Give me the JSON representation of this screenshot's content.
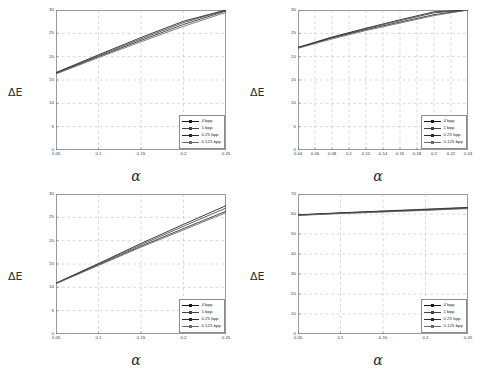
{
  "figure": {
    "ylabel": "ΔE",
    "xlabel": "α",
    "legend_labels": [
      "4 bpp",
      "1 bpp",
      "0.25 bpp",
      "0.125 bpp"
    ],
    "series_colors": [
      "#1a1a1a",
      "#444444",
      "#2b2b2b",
      "#6a6a6a"
    ]
  },
  "chart_data": [
    {
      "type": "line",
      "panel": "top-left",
      "title": "",
      "xlabel": "α",
      "ylabel": "ΔE",
      "xlim": [
        0.05,
        0.25
      ],
      "ylim": [
        0,
        30
      ],
      "xticks": [
        0.05,
        0.1,
        0.15,
        0.2,
        0.25
      ],
      "xticklabels": [
        "0.05",
        "0.1",
        "0.15",
        "0.2",
        "0.25"
      ],
      "yticks": [
        0,
        5,
        10,
        15,
        20,
        25,
        30
      ],
      "yticklabels": [
        "0",
        "5",
        "10",
        "15",
        "20",
        "25",
        "30"
      ],
      "grid": true,
      "legend_position": "lower right",
      "x": [
        0.05,
        0.1,
        0.15,
        0.2,
        0.25
      ],
      "series": [
        {
          "name": "4 bpp",
          "values": [
            16.6,
            20.4,
            24.1,
            27.6,
            30.0
          ]
        },
        {
          "name": "1 bpp",
          "values": [
            16.5,
            20.2,
            23.8,
            27.3,
            30.0
          ]
        },
        {
          "name": "0.25 bpp",
          "values": [
            16.4,
            20.0,
            23.5,
            26.9,
            29.8
          ]
        },
        {
          "name": "0.125 bpp",
          "values": [
            16.3,
            19.8,
            23.2,
            26.5,
            29.5
          ]
        }
      ]
    },
    {
      "type": "line",
      "panel": "top-right",
      "title": "",
      "xlabel": "α",
      "ylabel": "ΔE",
      "xlim": [
        0.04,
        0.24
      ],
      "ylim": [
        0,
        30
      ],
      "xticks": [
        0.04,
        0.06,
        0.08,
        0.1,
        0.12,
        0.14,
        0.16,
        0.18,
        0.2,
        0.22,
        0.24
      ],
      "xticklabels": [
        "0.04",
        "0.06",
        "0.08",
        "0.1",
        "0.12",
        "0.14",
        "0.16",
        "0.18",
        "0.2",
        "0.22",
        "0.24"
      ],
      "yticks": [
        0,
        5,
        10,
        15,
        20,
        25,
        30
      ],
      "yticklabels": [
        "0",
        "5",
        "10",
        "15",
        "20",
        "25",
        "30"
      ],
      "grid": true,
      "legend_position": "lower right",
      "x": [
        0.04,
        0.08,
        0.12,
        0.16,
        0.2,
        0.24
      ],
      "series": [
        {
          "name": "4 bpp",
          "values": [
            22.0,
            24.2,
            26.1,
            27.9,
            29.6,
            30.0
          ]
        },
        {
          "name": "1 bpp",
          "values": [
            21.9,
            24.1,
            26.0,
            27.7,
            29.4,
            30.0
          ]
        },
        {
          "name": "0.25 bpp",
          "values": [
            21.9,
            24.0,
            25.8,
            27.4,
            29.0,
            30.0
          ]
        },
        {
          "name": "0.125 bpp",
          "values": [
            21.8,
            23.8,
            25.6,
            27.2,
            28.8,
            30.0
          ]
        }
      ]
    },
    {
      "type": "line",
      "panel": "bottom-left",
      "title": "",
      "xlabel": "α",
      "ylabel": "ΔE",
      "xlim": [
        0.05,
        0.25
      ],
      "ylim": [
        0,
        30
      ],
      "xticks": [
        0.05,
        0.1,
        0.15,
        0.2,
        0.25
      ],
      "xticklabels": [
        "0.05",
        "0.1",
        "0.15",
        "0.2",
        "0.25"
      ],
      "yticks": [
        0,
        5,
        10,
        15,
        20,
        25,
        30
      ],
      "yticklabels": [
        "0",
        "5",
        "10",
        "15",
        "20",
        "25",
        "30"
      ],
      "grid": true,
      "legend_position": "lower right",
      "x": [
        0.05,
        0.1,
        0.15,
        0.2,
        0.25
      ],
      "series": [
        {
          "name": "4 bpp",
          "values": [
            10.9,
            15.1,
            19.4,
            23.5,
            27.5
          ]
        },
        {
          "name": "1 bpp",
          "values": [
            10.9,
            15.0,
            19.1,
            23.1,
            27.0
          ]
        },
        {
          "name": "0.25 bpp",
          "values": [
            10.8,
            14.8,
            18.8,
            22.6,
            26.3
          ]
        },
        {
          "name": "0.125 bpp",
          "values": [
            10.8,
            14.7,
            18.6,
            22.3,
            26.0
          ]
        }
      ]
    },
    {
      "type": "line",
      "panel": "bottom-right",
      "title": "",
      "xlabel": "α",
      "ylabel": "ΔE",
      "xlim": [
        0.05,
        0.25
      ],
      "ylim": [
        0,
        70
      ],
      "xticks": [
        0.05,
        0.1,
        0.15,
        0.2,
        0.25
      ],
      "xticklabels": [
        "0.05",
        "0.1",
        "0.15",
        "0.2",
        "0.25"
      ],
      "yticks": [
        0,
        10,
        20,
        30,
        40,
        50,
        60,
        70
      ],
      "yticklabels": [
        "0",
        "10",
        "20",
        "30",
        "40",
        "50",
        "60",
        "70"
      ],
      "grid": true,
      "legend_position": "lower right",
      "x": [
        0.05,
        0.1,
        0.15,
        0.2,
        0.25
      ],
      "series": [
        {
          "name": "4 bpp",
          "values": [
            59.6,
            60.6,
            61.5,
            62.4,
            63.3
          ]
        },
        {
          "name": "1 bpp",
          "values": [
            59.5,
            60.5,
            61.4,
            62.2,
            63.1
          ]
        },
        {
          "name": "0.25 bpp",
          "values": [
            59.4,
            60.4,
            61.2,
            62.0,
            62.9
          ]
        },
        {
          "name": "0.125 bpp",
          "values": [
            59.3,
            60.2,
            61.0,
            61.8,
            62.7
          ]
        }
      ]
    }
  ]
}
